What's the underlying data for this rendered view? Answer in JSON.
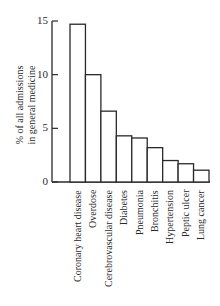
{
  "chart_data": {
    "type": "bar",
    "title": "",
    "xlabel": "",
    "ylabel": "% of all admissions in general medicine",
    "ylabel_lines": [
      "% of all admissions",
      "in general medicine"
    ],
    "categories": [
      "Coronary heart disease",
      "Overdose",
      "Cerebrovascular disease",
      "Diabetes",
      "Pneumonia",
      "Bronchitis",
      "Hypertension",
      "Peptic ulcer",
      "Lung cancer"
    ],
    "values": [
      14.7,
      10.0,
      6.6,
      4.3,
      4.1,
      3.2,
      2.0,
      1.7,
      1.1
    ],
    "ylim": [
      0,
      15
    ],
    "yticks": [
      0,
      5,
      10,
      15
    ],
    "grid": false,
    "legend": null
  },
  "style": {
    "bar_fill": "#ffffff",
    "bar_stroke": "#2a2a2a",
    "axis_color": "#2a2a2a"
  }
}
